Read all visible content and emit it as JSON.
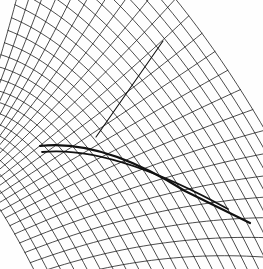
{
  "figure": {
    "title": "Ruled surface wireframe",
    "kind": "line-drawing",
    "width": 263,
    "height": 269,
    "background_color": "#fefefe",
    "line_color": "#111111",
    "accent_color": "#000000"
  },
  "chart_data": {
    "type": "line",
    "title": "Ruled surface wireframe",
    "xlabel": "",
    "ylabel": "",
    "xlim": [
      0,
      263
    ],
    "ylim": [
      0,
      269
    ],
    "grid": false,
    "legend": "none",
    "render": {
      "projection": "parallel",
      "stroke_width_thin": 0.75,
      "stroke_width_envelope": 2.2,
      "stroke_color": "#111111"
    },
    "generator": {
      "family_a_count": 26,
      "family_b_count": 26,
      "u_range": [
        -1.35,
        1.35
      ],
      "v_range": [
        -1.35,
        1.35
      ],
      "surface": "cuspidal-ruled",
      "cusp_point": [
        108,
        131
      ],
      "note": "x = a1*u + a2*v + a3*u*v ; y = b1*u + b2*v + b3*u*v + b4*u*u"
    },
    "anchors": {
      "top_left_apex": [
        42,
        14
      ],
      "left_pinch": [
        40,
        150
      ],
      "bottom_tip": [
        16,
        258
      ],
      "center_node": [
        108,
        131
      ],
      "upper_ray_end": [
        163,
        41
      ],
      "lower_right_end": [
        250,
        223
      ],
      "right_fan_end": [
        196,
        152
      ]
    },
    "series": [
      {
        "name": "family-a",
        "role": "ruling-lines",
        "count": 26
      },
      {
        "name": "family-b",
        "role": "cross-curves",
        "count": 26
      },
      {
        "name": "envelope",
        "role": "cuspidal-edge",
        "count": 1
      },
      {
        "name": "ray",
        "role": "straight-generator",
        "count": 1
      }
    ]
  }
}
